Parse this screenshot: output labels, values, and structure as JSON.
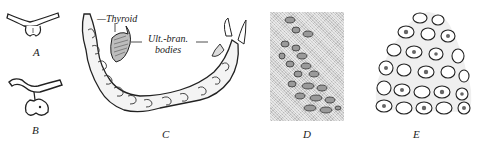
{
  "figure": {
    "panels": [
      {
        "id": "A",
        "label": "A"
      },
      {
        "id": "B",
        "label": "B"
      },
      {
        "id": "C",
        "label": "C"
      },
      {
        "id": "D",
        "label": "D"
      },
      {
        "id": "E",
        "label": "E"
      }
    ],
    "annotations": {
      "thyroid": "—Thyroid",
      "ult_bran_line1": "Ult.-bran.",
      "ult_bran_line2": "bodies"
    },
    "colors": {
      "ink": "#1a1a1a",
      "background": "#ffffff",
      "stipple": "#cfcfcf"
    }
  }
}
